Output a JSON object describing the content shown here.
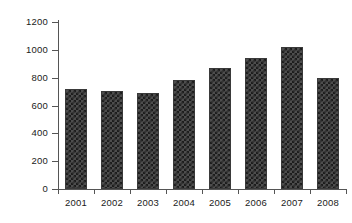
{
  "chart_data": {
    "type": "bar",
    "title": "",
    "xlabel": "",
    "ylabel": "Billion 2008$",
    "categories": [
      "2001",
      "2002",
      "2003",
      "2004",
      "2005",
      "2006",
      "2007",
      "2008"
    ],
    "values": [
      718,
      707,
      690,
      783,
      866,
      942,
      1020,
      795
    ],
    "ylim": [
      0,
      1200
    ],
    "yticks": [
      "0",
      "200",
      "400",
      "600",
      "800",
      "1000",
      "1200"
    ],
    "ytick_values": [
      0,
      200,
      400,
      600,
      800,
      1000,
      1200
    ],
    "grid": false,
    "legend": false,
    "legend_position": "none",
    "bar_fill": "#4d4d4d",
    "bar_pattern": "checkered",
    "bar_edge_color": "#3a3a3a",
    "axis_color": "#555555",
    "text_color": "#1a1a1a",
    "background": "#ffffff"
  }
}
